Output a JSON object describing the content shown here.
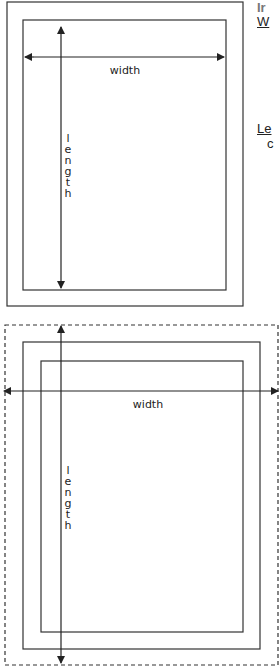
{
  "figure_top": {
    "width_label": "width",
    "length_letters": [
      "l",
      "e",
      "n",
      "g",
      "t",
      "h"
    ]
  },
  "figure_bottom": {
    "width_label": "width",
    "length_letters": [
      "l",
      "e",
      "n",
      "g",
      "t",
      "h"
    ]
  },
  "side_text": {
    "heading": "Ir",
    "width_term": "W",
    "length_term": "Le",
    "length_desc": "c"
  },
  "colors": {
    "line": "#222222",
    "heading": "#777777"
  }
}
